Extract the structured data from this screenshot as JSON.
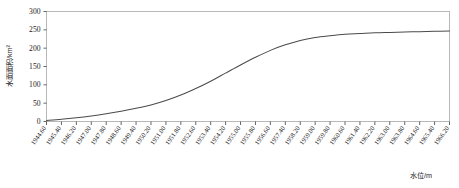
{
  "chart_data": {
    "type": "line",
    "title": "",
    "xlabel": "水位/m",
    "ylabel": "水面面积/km²",
    "xlim": [
      1944.6,
      1966.2
    ],
    "ylim": [
      0,
      300
    ],
    "ytick_step": 50,
    "xtick_step": 0.8,
    "grid": false,
    "legend": null,
    "line_color": "#4a4a4a",
    "frame_color": "#b8b8b8",
    "categories": [
      "1944.60",
      "1945.40",
      "1946.20",
      "1947.00",
      "1947.80",
      "1948.60",
      "1949.40",
      "1950.20",
      "1951.00",
      "1951.80",
      "1952.60",
      "1953.40",
      "1954.20",
      "1955.00",
      "1955.80",
      "1956.60",
      "1957.40",
      "1958.20",
      "1959.00",
      "1959.80",
      "1960.60",
      "1961.40",
      "1962.20",
      "1963.00",
      "1963.80",
      "1964.60",
      "1965.40",
      "1966.20"
    ],
    "ytick_labels": [
      "0",
      "50",
      "100",
      "150",
      "200",
      "250",
      "300"
    ],
    "x": [
      1944.6,
      1945.4,
      1946.2,
      1947.0,
      1947.8,
      1948.6,
      1949.4,
      1950.2,
      1951.0,
      1951.8,
      1952.6,
      1953.4,
      1954.2,
      1955.0,
      1955.8,
      1956.6,
      1957.4,
      1958.2,
      1959.0,
      1959.8,
      1960.6,
      1961.4,
      1962.2,
      1963.0,
      1963.8,
      1964.6,
      1965.4,
      1966.2
    ],
    "values": [
      3,
      6,
      10,
      15,
      21,
      28,
      36,
      45,
      57,
      72,
      90,
      110,
      132,
      154,
      175,
      194,
      209,
      221,
      229,
      234,
      238,
      240,
      242,
      243,
      244,
      245,
      246,
      247
    ],
    "series": [
      {
        "name": "水面面积",
        "values": [
          3,
          6,
          10,
          15,
          21,
          28,
          36,
          45,
          57,
          72,
          90,
          110,
          132,
          154,
          175,
          194,
          209,
          221,
          229,
          234,
          238,
          240,
          242,
          243,
          244,
          245,
          246,
          247
        ]
      }
    ]
  }
}
